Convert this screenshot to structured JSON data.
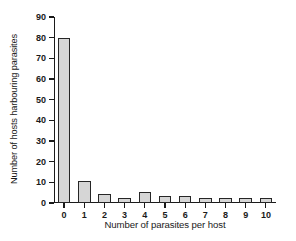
{
  "chart_data": {
    "type": "bar",
    "title": "",
    "subtitle": "",
    "xlabel": "Number of parasites per host",
    "ylabel": "Number of hosts harbouring parasites",
    "categories": [
      "0",
      "1",
      "2",
      "3",
      "4",
      "5",
      "6",
      "7",
      "8",
      "9",
      "10"
    ],
    "values": [
      80,
      10.5,
      4.5,
      2.5,
      5.5,
      3.5,
      3.5,
      2.5,
      2.5,
      2.5,
      2.5
    ],
    "series": [
      {
        "name": "Hosts harbouring parasites",
        "values": [
          80,
          10.5,
          4.5,
          2.5,
          5.5,
          3.5,
          3.5,
          2.5,
          2.5,
          2.5,
          2.5
        ]
      }
    ],
    "ylim": [
      0,
      90
    ],
    "yticks": [
      0,
      10,
      20,
      30,
      40,
      50,
      60,
      70,
      80,
      90
    ],
    "ytick_labels": [
      "0",
      "10",
      "20",
      "30",
      "40",
      "50",
      "60",
      "70",
      "80",
      "90"
    ],
    "grid": false,
    "legend": false,
    "legend_position": "none",
    "bar_fill_color": "#d6d6d6",
    "bar_edge_color": "#262626",
    "axis_color": "#1a1a1a",
    "background_color": "#ffffff"
  }
}
